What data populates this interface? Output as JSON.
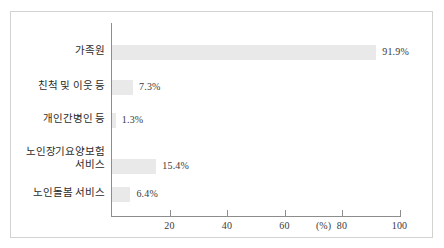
{
  "chart_data": {
    "type": "bar",
    "orientation": "horizontal",
    "title": "",
    "subtitle": "",
    "xlabel": "",
    "ylabel": "",
    "unit_label": "(%)",
    "xlim": [
      0,
      100
    ],
    "grid": false,
    "legend": null,
    "x_ticks": [
      {
        "value": 20,
        "label": "20"
      },
      {
        "value": 40,
        "label": "40"
      },
      {
        "value": 60,
        "label": "60"
      },
      {
        "value": 80,
        "label": "80"
      },
      {
        "value": 100,
        "label": "100"
      }
    ],
    "categories": [
      "가족원",
      "친척 및 이웃 등",
      "개인간병인 등",
      "노인장기요양보험\n서비스",
      "노인돌봄 서비스"
    ],
    "values": [
      91.9,
      7.3,
      1.3,
      15.4,
      6.4
    ],
    "value_labels": [
      "91.9%",
      "7.3%",
      "1.3%",
      "15.4%",
      "6.4%"
    ],
    "colors": {
      "bar_fill": "#e9e9e9",
      "axis_line": "#8d8d8d",
      "frame_border": "#d2d2d2",
      "text": "#2b2b2b",
      "background": "#ffffff"
    }
  }
}
